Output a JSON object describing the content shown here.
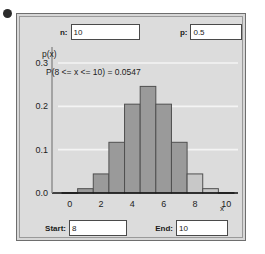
{
  "app": {
    "title": "Binomial Distribution Calculator"
  },
  "parameters": {
    "n_label": "n:",
    "n_value": "10",
    "n_placeholder": "n",
    "p_label": "p:",
    "p_value": "0.5",
    "p_placeholder": "p"
  },
  "range": {
    "start_label": "Start:",
    "start_value": "8",
    "start_placeholder": "start",
    "end_label": "End:",
    "end_value": "10",
    "end_placeholder": "end"
  },
  "colors": {
    "panel_background": "#dcdcdc",
    "panel_border": "#6e6e6e",
    "bar_fill": "#9a9a9a",
    "bar_highlight_fill": "#c8c8c8",
    "bar_stroke": "#4f4f4f",
    "gridline": "#f4f4f4",
    "axis": "#111111",
    "text": "#1a1a1a",
    "input_background": "#ffffff"
  },
  "icons": {
    "corner_dot": "bullet-dot-icon"
  },
  "chart_data": {
    "type": "bar",
    "title": "",
    "ylabel": "p(x)",
    "xlabel": "x",
    "annotation": "P(8 <= x <= 10) = 0.0547",
    "probability": "0.0547",
    "grid": true,
    "legend": "none",
    "xlim": [
      -0.5,
      10.5
    ],
    "ylim": [
      0,
      0.3
    ],
    "xticks": [
      "0",
      "2",
      "4",
      "6",
      "8",
      "10"
    ],
    "xtick_values": [
      0,
      2,
      4,
      6,
      8,
      10
    ],
    "yticks": [
      "0.0",
      "0.1",
      "0.2",
      "0.3"
    ],
    "ytick_values": [
      0.0,
      0.1,
      0.2,
      0.3
    ],
    "categories": [
      0,
      1,
      2,
      3,
      4,
      5,
      6,
      7,
      8,
      9,
      10
    ],
    "values": [
      0.001,
      0.01,
      0.044,
      0.117,
      0.205,
      0.246,
      0.205,
      0.117,
      0.044,
      0.01,
      0.001
    ],
    "highlighted": [
      8,
      9,
      10
    ],
    "highlight_range": [
      8,
      10
    ]
  }
}
